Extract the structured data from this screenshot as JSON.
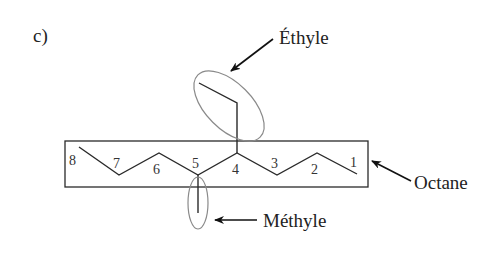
{
  "figure": {
    "panel_label": "c)",
    "labels": {
      "ethyl": "Éthyle",
      "octane": "Octane",
      "methyl": "Méthyle"
    },
    "carbon_numbers": [
      "8",
      "7",
      "6",
      "5",
      "4",
      "3",
      "2",
      "1"
    ],
    "colors": {
      "bond": "#2a2a2a",
      "ellipse": "#8a8a8a",
      "box": "#2a2a2a",
      "text": "#222222"
    }
  }
}
